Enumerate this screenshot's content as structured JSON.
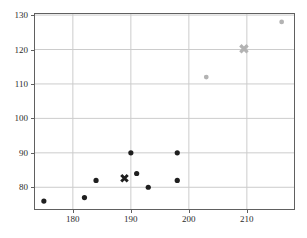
{
  "figure": {
    "background": "#ffffff"
  },
  "chart_data": {
    "type": "scatter",
    "title": "",
    "xlabel": "",
    "ylabel": "",
    "xlim": [
      173.3,
      218.3
    ],
    "ylim": [
      73.4,
      130.6
    ],
    "xticks": [
      180,
      190,
      200,
      210
    ],
    "yticks": [
      80,
      90,
      100,
      110,
      120,
      130
    ],
    "grid": true,
    "legend_position": "none",
    "series": [
      {
        "name": "dark-cluster-points",
        "marker": "circle",
        "color": "#1f1f1f",
        "marker_px": 5.2,
        "points": [
          [
            175,
            76
          ],
          [
            182,
            77
          ],
          [
            184,
            82
          ],
          [
            190,
            90
          ],
          [
            191,
            84
          ],
          [
            193,
            80
          ],
          [
            198,
            90
          ],
          [
            198,
            82
          ]
        ]
      },
      {
        "name": "light-cluster-points",
        "marker": "circle",
        "color": "#b3b3b3",
        "marker_px": 4.8,
        "points": [
          [
            203,
            112
          ],
          [
            216,
            128
          ]
        ]
      },
      {
        "name": "dark-cluster-centroid",
        "marker": "X",
        "color": "#1f1f1f",
        "marker_px": 9,
        "points": [
          [
            188.9,
            82.6
          ]
        ]
      },
      {
        "name": "light-cluster-centroid",
        "marker": "X",
        "color": "#b3b3b3",
        "marker_px": 10,
        "points": [
          [
            209.5,
            120.2
          ]
        ]
      }
    ],
    "style": {
      "grid_color": "#cccccc",
      "spine_color": "#606060",
      "tick_color": "#606060",
      "tick_label_color": "#2b2b2b",
      "plot_background": "#ffffff",
      "tick_length_px": 3
    }
  }
}
